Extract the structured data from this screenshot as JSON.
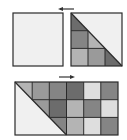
{
  "diagram": {
    "colors": {
      "border": "#2a2a2a",
      "blank": "#f0f0f0",
      "light": "#dedede",
      "mid_light": "#b4b4b4",
      "mid": "#9a9a9a",
      "mid_dark": "#858585",
      "dark": "#6c6c6c"
    },
    "top_arrow": {
      "direction": "left"
    },
    "bottom_arrow": {
      "direction": "right"
    },
    "top_left_square": {
      "grid": [
        1,
        1
      ],
      "fill": "blank"
    },
    "top_right_square": {
      "grid": [
        3,
        3
      ],
      "diagonal": "top-left to bottom-right",
      "cells": [
        [
          "dark-half",
          "blank",
          "blank"
        ],
        [
          "mid_dark",
          "mid_light-half",
          "blank"
        ],
        [
          "mid_light",
          "mid",
          "dark-half"
        ]
      ]
    },
    "bottom_rectangle": {
      "grid": [
        3,
        6
      ],
      "diagonal": "top-left to bottom of column 3",
      "cells": [
        [
          "mid_light-half",
          "mid",
          "mid_dark",
          "dark",
          "light",
          "mid_dark"
        ],
        [
          "blank",
          "mid-half",
          "dark",
          "mid_light",
          "mid_dark",
          "light"
        ],
        [
          "blank",
          "blank",
          "mid_dark-half",
          "mid_light",
          "light",
          "mid_dark"
        ]
      ]
    }
  }
}
